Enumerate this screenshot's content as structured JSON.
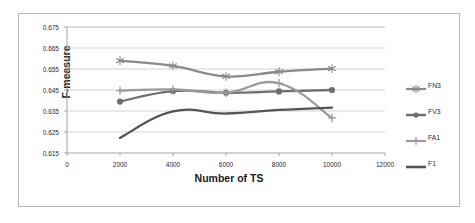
{
  "chart_data": {
    "type": "line",
    "title": "",
    "xlabel": "Number of TS",
    "ylabel": "F-measure",
    "x": [
      2000,
      4000,
      6000,
      8000,
      10000
    ],
    "xlim": [
      0,
      12000
    ],
    "ylim": [
      0.615,
      0.675
    ],
    "xticks": [
      "0",
      "2000",
      "4000",
      "6000",
      "8000",
      "10000",
      "12000"
    ],
    "yticks": [
      "0.615",
      "0.625",
      "0.635",
      "0.645",
      "0.655",
      "0.665",
      "0.675"
    ],
    "grid": "horizontal",
    "legend_position": "right",
    "series": [
      {
        "name": "FN3",
        "marker": "asterisk",
        "color": "#8a8a8a",
        "values": [
          0.659,
          0.6565,
          0.6515,
          0.6537,
          0.6552
        ]
      },
      {
        "name": "FV3",
        "marker": "circle",
        "color": "#6f6f6f",
        "values": [
          0.6395,
          0.6445,
          0.6437,
          0.6443,
          0.645
        ]
      },
      {
        "name": "FA1",
        "marker": "plus",
        "color": "#9b9b9b",
        "values": [
          0.6447,
          0.6453,
          0.6437,
          0.6482,
          0.6317
        ]
      },
      {
        "name": "F1",
        "marker": "none",
        "color": "#555555",
        "values": [
          0.6222,
          0.6348,
          0.6338,
          0.6355,
          0.6366
        ]
      }
    ]
  },
  "legend": {
    "items": [
      {
        "label": "FN3"
      },
      {
        "label": "FV3"
      },
      {
        "label": "FA1"
      },
      {
        "label": "F1"
      }
    ]
  }
}
